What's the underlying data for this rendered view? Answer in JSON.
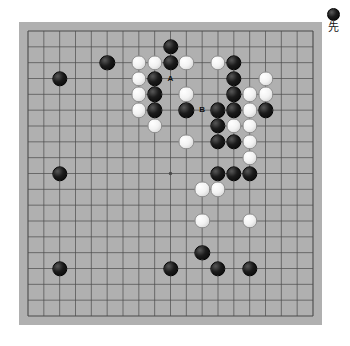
{
  "diagram": {
    "type": "go-board",
    "board_size": 19,
    "board_color": "#b0b0b0",
    "frame_color": "#a8a8a8",
    "line_color": "#4a4a4a",
    "black_color": "#0a0a0a",
    "white_color": "#f5f5f5",
    "star_points": [
      {
        "col": 3,
        "row": 3
      },
      {
        "col": 9,
        "row": 3
      },
      {
        "col": 15,
        "row": 3
      },
      {
        "col": 3,
        "row": 9
      },
      {
        "col": 9,
        "row": 9
      },
      {
        "col": 15,
        "row": 9
      },
      {
        "col": 3,
        "row": 15
      },
      {
        "col": 9,
        "row": 15
      },
      {
        "col": 15,
        "row": 15
      }
    ],
    "visible_star_points": [
      {
        "col": 9,
        "row": 9
      }
    ]
  },
  "legend": {
    "stone_color": "black",
    "stone_icon": "black-stone-icon",
    "text": "先"
  },
  "stones": [
    {
      "color": "black",
      "col": 2,
      "row": 3
    },
    {
      "color": "black",
      "col": 2,
      "row": 9
    },
    {
      "color": "black",
      "col": 2,
      "row": 15
    },
    {
      "color": "black",
      "col": 5,
      "row": 2
    },
    {
      "color": "black",
      "col": 9,
      "row": 15
    },
    {
      "color": "black",
      "col": 11,
      "row": 14
    },
    {
      "color": "black",
      "col": 12,
      "row": 15
    },
    {
      "color": "black",
      "col": 14,
      "row": 15
    },
    {
      "color": "white",
      "col": 7,
      "row": 2
    },
    {
      "color": "white",
      "col": 8,
      "row": 2
    },
    {
      "color": "black",
      "col": 9,
      "row": 1
    },
    {
      "color": "black",
      "col": 9,
      "row": 2
    },
    {
      "color": "white",
      "col": 10,
      "row": 2
    },
    {
      "color": "white",
      "col": 7,
      "row": 3
    },
    {
      "color": "black",
      "col": 8,
      "row": 3
    },
    {
      "color": "white",
      "col": 7,
      "row": 4
    },
    {
      "color": "black",
      "col": 8,
      "row": 4
    },
    {
      "color": "white",
      "col": 7,
      "row": 5
    },
    {
      "color": "black",
      "col": 8,
      "row": 5
    },
    {
      "color": "white",
      "col": 8,
      "row": 6
    },
    {
      "color": "white",
      "col": 10,
      "row": 4
    },
    {
      "color": "black",
      "col": 10,
      "row": 5
    },
    {
      "color": "white",
      "col": 10,
      "row": 7
    },
    {
      "color": "white",
      "col": 12,
      "row": 2
    },
    {
      "color": "black",
      "col": 13,
      "row": 2
    },
    {
      "color": "black",
      "col": 13,
      "row": 3
    },
    {
      "color": "white",
      "col": 15,
      "row": 3
    },
    {
      "color": "black",
      "col": 13,
      "row": 4
    },
    {
      "color": "white",
      "col": 14,
      "row": 4
    },
    {
      "color": "white",
      "col": 15,
      "row": 4
    },
    {
      "color": "black",
      "col": 12,
      "row": 5
    },
    {
      "color": "black",
      "col": 13,
      "row": 5
    },
    {
      "color": "white",
      "col": 14,
      "row": 5
    },
    {
      "color": "black",
      "col": 15,
      "row": 5
    },
    {
      "color": "black",
      "col": 12,
      "row": 6
    },
    {
      "color": "white",
      "col": 13,
      "row": 6
    },
    {
      "color": "white",
      "col": 14,
      "row": 6
    },
    {
      "color": "black",
      "col": 12,
      "row": 7
    },
    {
      "color": "black",
      "col": 13,
      "row": 7
    },
    {
      "color": "white",
      "col": 14,
      "row": 7
    },
    {
      "color": "white",
      "col": 14,
      "row": 8
    },
    {
      "color": "black",
      "col": 12,
      "row": 9
    },
    {
      "color": "black",
      "col": 13,
      "row": 9
    },
    {
      "color": "black",
      "col": 14,
      "row": 9
    },
    {
      "color": "white",
      "col": 11,
      "row": 10
    },
    {
      "color": "white",
      "col": 12,
      "row": 10
    },
    {
      "color": "white",
      "col": 11,
      "row": 12
    },
    {
      "color": "white",
      "col": 14,
      "row": 12
    }
  ],
  "labels": [
    {
      "text": "A",
      "col": 9,
      "row": 3
    },
    {
      "text": "B",
      "col": 11,
      "row": 5
    }
  ]
}
